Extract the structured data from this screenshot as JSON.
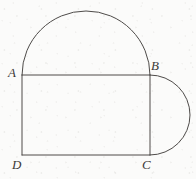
{
  "figure": {
    "kind": "plane-geometry-diagram",
    "stroke_color": "#4e4b49",
    "background_color": "#fbfbfa",
    "label_color": "#3c3a38",
    "canvas": {
      "width": 196,
      "height": 179
    },
    "vertices": [
      {
        "id": "A",
        "label": "A",
        "x": 22,
        "y": 75
      },
      {
        "id": "B",
        "label": "B",
        "x": 150,
        "y": 75
      },
      {
        "id": "C",
        "label": "C",
        "x": 150,
        "y": 155
      },
      {
        "id": "D",
        "label": "D",
        "x": 22,
        "y": 155
      }
    ],
    "segments": [
      {
        "id": "AB",
        "from": "A",
        "to": "B",
        "path": "M 22 75 L 150 75"
      },
      {
        "id": "BC",
        "from": "B",
        "to": "C",
        "path": "M 150 75 L 150 155"
      },
      {
        "id": "CD",
        "from": "C",
        "to": "D",
        "path": "M 150 155 L 22 155"
      },
      {
        "id": "DA",
        "from": "D",
        "to": "A",
        "path": "M 22 155 L 22 75"
      }
    ],
    "arcs": [
      {
        "id": "semicircle-on-AB",
        "on_segment": "AB",
        "bulge": "up",
        "center_x": 86,
        "center_y": 75,
        "radius": 64,
        "path": "M 22 75 A 64 64 0 0 1 150 75"
      },
      {
        "id": "semicircle-on-BC",
        "on_segment": "BC",
        "bulge": "right",
        "center_x": 150,
        "center_y": 115,
        "radius": 40,
        "path": "M 150 75 A 40 40 0 0 1 150 155"
      }
    ],
    "labels": {
      "a": "A",
      "b": "B",
      "c": "C",
      "d": "D"
    }
  }
}
